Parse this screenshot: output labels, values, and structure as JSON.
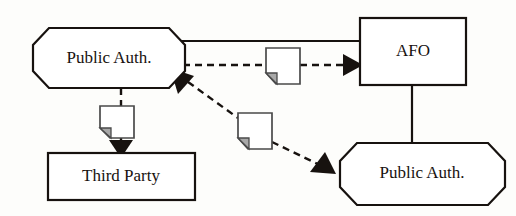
{
  "diagram": {
    "background_color": "#fdfdfb",
    "line_color": "#17120f",
    "doc_fold_color": "#a8a8a8",
    "nodes": [
      {
        "id": "public-auth-top",
        "label": "Public Auth.",
        "shape": "octagon",
        "x": 33,
        "y": 28,
        "width": 152,
        "height": 60
      },
      {
        "id": "afo",
        "label": "AFO",
        "shape": "rectangle",
        "x": 360,
        "y": 18,
        "width": 106,
        "height": 67
      },
      {
        "id": "third-party",
        "label": "Third Party",
        "shape": "rectangle",
        "x": 48,
        "y": 153,
        "width": 147,
        "height": 47
      },
      {
        "id": "public-auth-bottom",
        "label": "Public Auth.",
        "shape": "octagon",
        "x": 340,
        "y": 143,
        "width": 165,
        "height": 62
      }
    ],
    "edges": [
      {
        "id": "edge-top-solid",
        "from": "public-auth-top",
        "to": "afo",
        "style": "solid",
        "arrow": "none"
      },
      {
        "id": "edge-top-dashed",
        "from": "public-auth-top",
        "to": "afo",
        "style": "dashed",
        "arrow": "target",
        "icon": "document-icon"
      },
      {
        "id": "edge-afo-vertical",
        "from": "afo",
        "to": "public-auth-bottom",
        "style": "solid",
        "arrow": "none"
      },
      {
        "id": "edge-diagonal-dashed",
        "from": "public-auth-bottom",
        "to": "public-auth-top",
        "style": "dashed",
        "arrow": "both",
        "icon": "document-icon"
      },
      {
        "id": "edge-third-party-dashed",
        "from": "public-auth-top",
        "to": "third-party",
        "style": "dashed",
        "arrow": "target",
        "icon": "document-icon"
      }
    ],
    "icons": [
      {
        "id": "doc-top",
        "name": "document-icon",
        "x": 266,
        "y": 48
      },
      {
        "id": "doc-diagonal",
        "name": "document-icon",
        "x": 238,
        "y": 113
      },
      {
        "id": "doc-vertical",
        "name": "document-icon",
        "x": 100,
        "y": 106
      }
    ],
    "scan_artifacts": [
      {
        "id": "bleed-1",
        "text": "",
        "x": 60,
        "y": 22
      },
      {
        "id": "bleed-2",
        "text": "",
        "x": 300,
        "y": 22
      },
      {
        "id": "bleed-3",
        "text": "",
        "x": 60,
        "y": 122
      },
      {
        "id": "bleed-4",
        "text": "",
        "x": 300,
        "y": 186
      }
    ]
  }
}
